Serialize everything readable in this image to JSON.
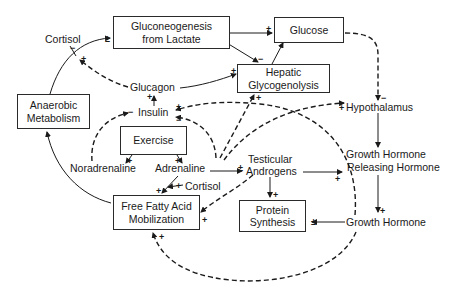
{
  "diagram": {
    "type": "physiological feedback pathway",
    "boxes": {
      "gluconeogenesis": {
        "line1": "Gluconeogenesis",
        "line2": "from Lactate"
      },
      "glucose": {
        "line1": "Glucose"
      },
      "hepatic": {
        "line1": "Hepatic",
        "line2": "Glycogenolysis"
      },
      "anaerobic": {
        "line1": "Anaerobic",
        "line2": "Metabolism"
      },
      "exercise": {
        "line1": "Exercise"
      },
      "ffa": {
        "line1": "Free Fatty Acid",
        "line2": "Mobilization"
      },
      "protein": {
        "line1": "Protein",
        "line2": "Synthesis"
      }
    },
    "labels": {
      "cortisol_top": "Cortisol",
      "glucagon": "Glucagon",
      "insulin": "Insulin",
      "noradrenaline": "Noradrenaline",
      "adrenaline": "Adrenaline",
      "cortisol_bottom": "Cortisol",
      "androgens_line1": "Testicular",
      "androgens_line2": "Androgens",
      "hypothalamus": "Hypothalamus",
      "ghrh_line1": "Growth Hormone",
      "ghrh_line2": "Releasing Hormone",
      "gh": "Growth Hormone"
    },
    "signs": {
      "plus": "+",
      "minus": "−",
      "plusminus": "±"
    },
    "edges": [
      {
        "from": "Anaerobic Metabolism",
        "to": "Gluconeogenesis from Lactate",
        "sign": "+",
        "style": "solid"
      },
      {
        "from": "Cortisol",
        "to": "Gluconeogenesis pathway",
        "sign": "-",
        "style": "solid"
      },
      {
        "from": "Glucagon",
        "to": "Gluconeogenesis pathway",
        "sign": "+",
        "style": "dashed"
      },
      {
        "from": "Gluconeogenesis from Lactate",
        "to": "Glucose",
        "sign": "+",
        "style": "solid"
      },
      {
        "from": "Gluconeogenesis from Lactate",
        "to": "Hepatic Glycogenolysis",
        "sign": "-",
        "style": "solid"
      },
      {
        "from": "Hepatic Glycogenolysis",
        "to": "Glucose",
        "sign": "",
        "style": "solid"
      },
      {
        "from": "Glucagon",
        "to": "Hepatic Glycogenolysis",
        "sign": "+",
        "style": "solid"
      },
      {
        "from": "Insulin",
        "to": "Glucagon",
        "sign": "+",
        "style": "solid"
      },
      {
        "from": "Glucose",
        "to": "Hypothalamus",
        "sign": "-",
        "style": "dashed"
      },
      {
        "from": "Hypothalamus",
        "to": "Growth Hormone Releasing Hormone",
        "sign": "",
        "style": "solid"
      },
      {
        "from": "Growth Hormone Releasing Hormone",
        "to": "Growth Hormone",
        "sign": "+",
        "style": "solid"
      },
      {
        "from": "Growth Hormone",
        "to": "Protein Synthesis",
        "sign": "±",
        "style": "solid"
      },
      {
        "from": "Exercise",
        "to": "Noradrenaline",
        "sign": "+",
        "style": "solid"
      },
      {
        "from": "Exercise",
        "to": "Adrenaline",
        "sign": "+",
        "style": "solid"
      },
      {
        "from": "Noradrenaline",
        "to": "Insulin",
        "sign": "-",
        "style": "dashed"
      },
      {
        "from": "Adrenaline",
        "to": "Insulin",
        "sign": "-",
        "style": "dashed"
      },
      {
        "from": "Adrenaline",
        "to": "Testicular Androgens",
        "sign": "±",
        "style": "solid"
      },
      {
        "from": "Adrenaline",
        "to": "Free Fatty Acid Mobilization",
        "sign": "+",
        "style": "solid"
      },
      {
        "from": "Cortisol",
        "to": "Free Fatty Acid Mobilization",
        "sign": "+",
        "style": "solid"
      },
      {
        "from": "Adrenaline",
        "to": "Hepatic Glycogenolysis",
        "sign": "+",
        "style": "dashed"
      },
      {
        "from": "Adrenaline",
        "to": "Hypothalamus",
        "sign": "+",
        "style": "dashed"
      },
      {
        "from": "Testicular Androgens",
        "to": "Protein Synthesis",
        "sign": "+",
        "style": "solid"
      },
      {
        "from": "Testicular Androgens",
        "to": "Growth Hormone Releasing Hormone",
        "sign": "+",
        "style": "solid"
      },
      {
        "from": "Testicular Androgens",
        "to": "Free Fatty Acid Mobilization",
        "sign": "+",
        "style": "dashed"
      },
      {
        "from": "Growth Hormone",
        "to": "Insulin",
        "sign": "+",
        "style": "dashed"
      },
      {
        "from": "Growth Hormone",
        "to": "Free Fatty Acid Mobilization",
        "sign": "+",
        "style": "dashed"
      },
      {
        "from": "Free Fatty Acid Mobilization",
        "to": "Anaerobic Metabolism",
        "sign": "",
        "style": "solid"
      }
    ]
  }
}
